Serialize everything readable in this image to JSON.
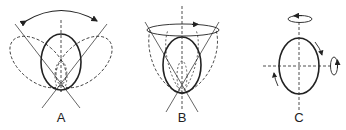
{
  "diagram": {
    "panels": [
      {
        "id": "A",
        "label": "A",
        "description": "Ellipse rocking side to side about bottom pivot (dashed tilted positions, double-headed arc arrow)"
      },
      {
        "id": "B",
        "label": "B",
        "description": "Ellipse sweeping a cone about vertical axis (circular arrow at top)"
      },
      {
        "id": "C",
        "label": "C",
        "description": "Ellipse rotating about its own axes (vertical and horizontal rotation arrows, in-plane rotation arrows)"
      }
    ],
    "colors": {
      "stroke": "#222222",
      "background": "#ffffff"
    }
  }
}
